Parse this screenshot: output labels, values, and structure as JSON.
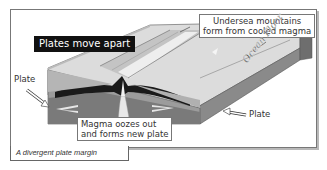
{
  "title_tag": "Plates move apart",
  "labels": {
    "undersea_line1": "Undersea mountains",
    "undersea_line2": "form from cooled magma",
    "plate_left": "Plate",
    "plate_right": "Plate",
    "magma_line1": "Magma oozes out",
    "magma_line2": "and forms new plate",
    "ocean_floor": "Ocean Floor"
  },
  "caption": "A divergent plate margin",
  "colors": {
    "frame_border": "#777777",
    "title_bg": "#111111",
    "title_text": "#ffffff",
    "plate_dark": "#707070",
    "plate_mid": "#9a9a9a",
    "seafloor": "#d6d6d6",
    "magma_black": "#1a1a1a"
  }
}
